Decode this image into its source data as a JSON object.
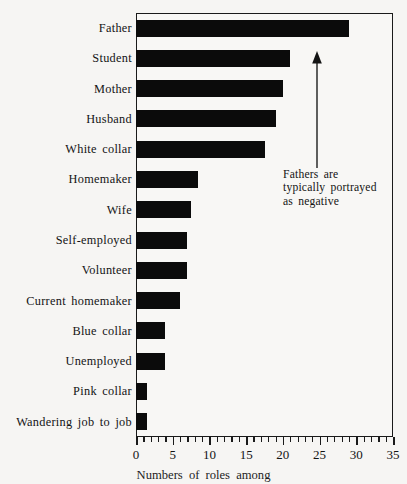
{
  "chart_data": {
    "type": "bar",
    "orientation": "horizontal",
    "title": "",
    "subtitle": "",
    "xlabel": "Numbers of roles among",
    "ylabel": "",
    "xlim": [
      0,
      35
    ],
    "grid": false,
    "legend": null,
    "bar_color": "#0b0b0b",
    "frame_color": "#1a1a1a",
    "background_color": "#f6f5f3",
    "categories": [
      "Father",
      "Student",
      "Mother",
      "Husband",
      "White collar",
      "Homemaker",
      "Wife",
      "Self-employed",
      "Volunteer",
      "Current homemaker",
      "Blue collar",
      "Unemployed",
      "Pink collar",
      "Wandering job to job"
    ],
    "values": [
      29,
      21,
      20,
      19,
      17.5,
      8.5,
      7.5,
      7,
      7,
      6,
      4,
      4,
      1.5,
      1.5
    ],
    "xticks": [
      0,
      5,
      10,
      15,
      20,
      25,
      30,
      35
    ],
    "xticklabels": [
      "0",
      "5",
      "10",
      "15",
      "20",
      "25",
      "30",
      "35"
    ],
    "minor_ticks_per_interval": 4,
    "annotations": [
      {
        "text_lines": [
          "Fathers  are",
          "typically  portrayed",
          "as  negative"
        ],
        "arrow": "up-arrow",
        "points_to_category": "Father"
      }
    ]
  },
  "caption": {
    "text": "Numbers  of  roles  among"
  }
}
